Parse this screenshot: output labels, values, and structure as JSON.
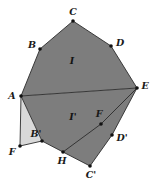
{
  "figure": {
    "canvas": {
      "width": 151,
      "height": 184
    },
    "colors": {
      "background": "#ffffff",
      "main_fill": "#7d7d7d",
      "light_fill": "#d9d9d9",
      "stroke": "#2b2b2b",
      "vertex_dot": "#111111",
      "label_text": "#1a1a1a"
    },
    "stroke_width": 0.9,
    "vertex_dot_radius": 1.7
  },
  "points": {
    "A": {
      "label": "A",
      "x": 21,
      "y": 96,
      "lx": 12,
      "ly": 96
    },
    "B": {
      "label": "B",
      "x": 40,
      "y": 49,
      "lx": 32,
      "ly": 45
    },
    "C": {
      "label": "C",
      "x": 73,
      "y": 21,
      "lx": 73,
      "ly": 12
    },
    "D": {
      "label": "D",
      "x": 111,
      "y": 46,
      "lx": 120,
      "ly": 43
    },
    "E": {
      "label": "E",
      "x": 137,
      "y": 88,
      "lx": 145,
      "ly": 86
    },
    "F": {
      "label": "F",
      "x": 20,
      "y": 146,
      "lx": 12,
      "ly": 152
    },
    "Bp": {
      "label": "B'",
      "x": 42,
      "y": 141,
      "lx": 36,
      "ly": 134
    },
    "H": {
      "label": "H",
      "x": 63,
      "y": 152,
      "lx": 62,
      "ly": 161
    },
    "Cp": {
      "label": "C'",
      "x": 90,
      "y": 166,
      "lx": 91,
      "ly": 175
    },
    "Dp": {
      "label": "D'",
      "x": 112,
      "y": 135,
      "lx": 122,
      "ly": 138
    },
    "Fp": {
      "label": "F",
      "x": 101,
      "y": 124,
      "lx": 99,
      "ly": 114
    }
  },
  "regions": {
    "upper": {
      "name": "region-I",
      "label": "I",
      "lx": 72,
      "ly": 61,
      "fill": "#7d7d7d",
      "path": "M 21 96 L 40 49 L 73 21 L 111 46 L 137 88 Z"
    },
    "lower": {
      "name": "region-I-prime",
      "label": "I'",
      "lx": 73,
      "ly": 117,
      "fill": "#7d7d7d",
      "path": "M 21 96 L 137 88 L 112 135 L 90 166 L 63 152 L 42 141 Z"
    },
    "light_triangle": {
      "name": "triangle-A-F-B-prime",
      "fill": "#d9d9d9",
      "path": "M 21 96 L 20 146 L 42 141 Z"
    }
  },
  "segments": [
    {
      "name": "segment-A-E",
      "from": "A",
      "to": "E"
    },
    {
      "name": "segment-A-F",
      "from": "A",
      "to": "F"
    },
    {
      "name": "segment-F-Bp",
      "from": "F",
      "to": "Bp"
    },
    {
      "name": "segment-Bp-H",
      "from": "Bp",
      "to": "H"
    },
    {
      "name": "segment-H-Cp",
      "from": "H",
      "to": "Cp"
    },
    {
      "name": "segment-Cp-Dp",
      "from": "Cp",
      "to": "Dp"
    },
    {
      "name": "segment-Dp-E",
      "from": "Dp",
      "to": "E"
    },
    {
      "name": "segment-E-Fp-H",
      "from": "E",
      "to": "H"
    },
    {
      "name": "segment-A-Bp",
      "from": "A",
      "to": "Bp"
    },
    {
      "name": "segment-A-B",
      "from": "A",
      "to": "B"
    },
    {
      "name": "segment-B-C",
      "from": "B",
      "to": "C"
    },
    {
      "name": "segment-C-D",
      "from": "C",
      "to": "D"
    },
    {
      "name": "segment-D-E",
      "from": "D",
      "to": "E"
    }
  ]
}
